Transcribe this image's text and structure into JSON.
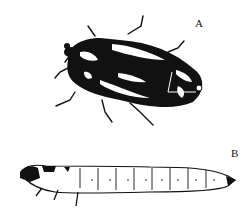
{
  "figure": {
    "panels": [
      {
        "id": "A",
        "label": "A",
        "subject": "adult-beetle"
      },
      {
        "id": "B",
        "label": "B",
        "subject": "larva"
      }
    ]
  },
  "colors": {
    "ink": "#111111",
    "background": "#ffffff"
  }
}
